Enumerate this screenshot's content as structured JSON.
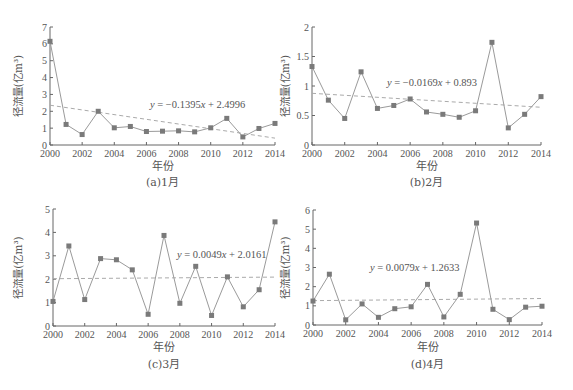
{
  "chart_data": [
    {
      "type": "line",
      "title": "(a)1月",
      "xlabel": "年份",
      "ylabel": "径流量(亿m³)",
      "x": [
        2000,
        2001,
        2002,
        2003,
        2004,
        2005,
        2006,
        2007,
        2008,
        2009,
        2010,
        2011,
        2012,
        2013,
        2014
      ],
      "series": [
        {
          "name": "径流量",
          "values": [
            6.15,
            1.22,
            0.62,
            2.0,
            1.02,
            1.1,
            0.8,
            0.82,
            0.84,
            0.78,
            1.02,
            1.58,
            0.48,
            0.98,
            1.28
          ]
        }
      ],
      "trendline": {
        "equation": "y = −0.1395x + 2.4996",
        "slope": -0.1395,
        "intercept": 2.4996
      },
      "ylim": [
        0,
        7
      ],
      "yticks": [
        0,
        1,
        2,
        3,
        4,
        5,
        6,
        7
      ],
      "xticks": [
        2000,
        2002,
        2004,
        2006,
        2008,
        2010,
        2012,
        2014
      ],
      "grid": false,
      "legend": "none"
    },
    {
      "type": "line",
      "title": "(b)2月",
      "xlabel": "年份",
      "ylabel": "径流量(亿m³)",
      "x": [
        2000,
        2001,
        2002,
        2003,
        2004,
        2005,
        2006,
        2007,
        2008,
        2009,
        2010,
        2011,
        2012,
        2013,
        2014
      ],
      "series": [
        {
          "name": "径流量",
          "values": [
            1.33,
            0.76,
            0.45,
            1.24,
            0.62,
            0.67,
            0.78,
            0.56,
            0.52,
            0.47,
            0.58,
            1.74,
            0.29,
            0.52,
            0.82
          ]
        }
      ],
      "trendline": {
        "equation": "y = −0.0169x + 0.893",
        "slope": -0.0169,
        "intercept": 0.893
      },
      "ylim": [
        0,
        2
      ],
      "yticks": [
        0,
        0.5,
        1,
        1.5,
        2
      ],
      "xticks": [
        2000,
        2002,
        2004,
        2006,
        2008,
        2010,
        2012,
        2014
      ],
      "grid": false,
      "legend": "none"
    },
    {
      "type": "line",
      "title": "(c)3月",
      "xlabel": "年份",
      "ylabel": "径流量(亿m³)",
      "x": [
        2000,
        2001,
        2002,
        2003,
        2004,
        2005,
        2006,
        2007,
        2008,
        2009,
        2010,
        2011,
        2012,
        2013,
        2014
      ],
      "series": [
        {
          "name": "径流量",
          "values": [
            1.05,
            3.42,
            1.13,
            2.88,
            2.83,
            2.4,
            0.5,
            3.87,
            0.97,
            2.55,
            0.45,
            2.1,
            0.82,
            1.55,
            4.45
          ]
        }
      ],
      "trendline": {
        "equation": "y = 0.0049x + 2.0161",
        "slope": 0.0049,
        "intercept": 2.0161
      },
      "ylim": [
        0,
        5
      ],
      "yticks": [
        0,
        1,
        2,
        3,
        4,
        5
      ],
      "xticks": [
        2000,
        2002,
        2004,
        2006,
        2008,
        2010,
        2012,
        2014
      ],
      "grid": false,
      "legend": "none"
    },
    {
      "type": "line",
      "title": "(d)4月",
      "xlabel": "年份",
      "ylabel": "径流量(亿m³)",
      "x": [
        2000,
        2001,
        2002,
        2003,
        2004,
        2005,
        2006,
        2007,
        2008,
        2009,
        2010,
        2011,
        2012,
        2013,
        2014
      ],
      "series": [
        {
          "name": "径流量",
          "values": [
            1.25,
            2.65,
            0.27,
            1.1,
            0.4,
            0.85,
            0.95,
            2.12,
            0.42,
            1.6,
            5.32,
            0.82,
            0.28,
            0.93,
            0.98
          ]
        }
      ],
      "trendline": {
        "equation": "y = 0.0079x + 1.2633",
        "slope": 0.0079,
        "intercept": 1.2633
      },
      "ylim": [
        0,
        6
      ],
      "yticks": [
        0,
        1,
        2,
        3,
        4,
        5,
        6
      ],
      "xticks": [
        2000,
        2002,
        2004,
        2006,
        2008,
        2010,
        2012,
        2014
      ],
      "grid": false,
      "legend": "none"
    }
  ],
  "style": {
    "line_color": "#9a9a9a",
    "marker_color": "#7a7a7a",
    "trend_color": "#aaaaaa",
    "axis_color": "#666666",
    "text_color": "#555555"
  },
  "layout": [
    {
      "x0": 50,
      "x1": 275,
      "y0": 145,
      "y1": 27,
      "eq_x": 150,
      "eq_y": 108,
      "ylabel_x": 22,
      "xlabel_y": 170,
      "caption_y": 186
    },
    {
      "x0": 312,
      "x1": 541,
      "y0": 145,
      "y1": 27,
      "eq_x": 387,
      "eq_y": 86,
      "ylabel_x": 289,
      "xlabel_y": 170,
      "caption_y": 186
    },
    {
      "x0": 53,
      "x1": 275,
      "y0": 326,
      "y1": 209,
      "eq_x": 177,
      "eq_y": 258,
      "ylabel_x": 22,
      "xlabel_y": 351,
      "caption_y": 368
    },
    {
      "x0": 313,
      "x1": 542,
      "y0": 325,
      "y1": 210,
      "eq_x": 370,
      "eq_y": 271,
      "ylabel_x": 289,
      "xlabel_y": 351,
      "caption_y": 368
    }
  ]
}
